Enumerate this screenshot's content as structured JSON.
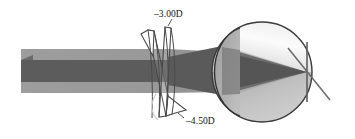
{
  "figure": {
    "type": "optical-ray-diagram",
    "background_color": "#ffffff"
  },
  "labels": {
    "top_lens_power": "–3.00D",
    "bottom_lens_power": "–4.50D"
  },
  "colors": {
    "beam_outer": "#9a9a9a",
    "beam_inner": "#5c5c5c",
    "beam_mid": "#7d7d7d",
    "eye_outline": "#3a3a3a",
    "eye_upper_fill": "#f4f4f4",
    "eye_lower_fill": "#b9b9b9",
    "cornea_fill": "#a8a8a8",
    "lens_outline": "#4a4a4a",
    "lens_fill": "#ffffff",
    "retina_line": "#6a6a6a",
    "label_text": "#111111"
  },
  "elements": {
    "incoming_beam": "horizontal collimated light band entering from left edge",
    "outer_beam_band": "light gray wide band",
    "inner_beam_band": "dark gray narrow band",
    "spectacle_lens_vertical": "near-vertical minus cylinder lens",
    "spectacle_lens_tilted": "tilted minus cylinder lens",
    "eyeball": "large sphere at right",
    "cornea": "anterior bulge arc on left of eyeball",
    "focal_point": "convergence point at retina",
    "retina_marker_vertical": "vertical line at focal point",
    "retina_marker_diagonal": "diagonal line through focal point"
  },
  "geometry": {
    "eye_center_x": 262,
    "eye_center_y": 72,
    "eye_radius": 50,
    "focal_point_x": 307,
    "focal_point_y": 72,
    "beam_top_y": 49,
    "beam_bottom_y": 93,
    "lens_x": 168
  }
}
